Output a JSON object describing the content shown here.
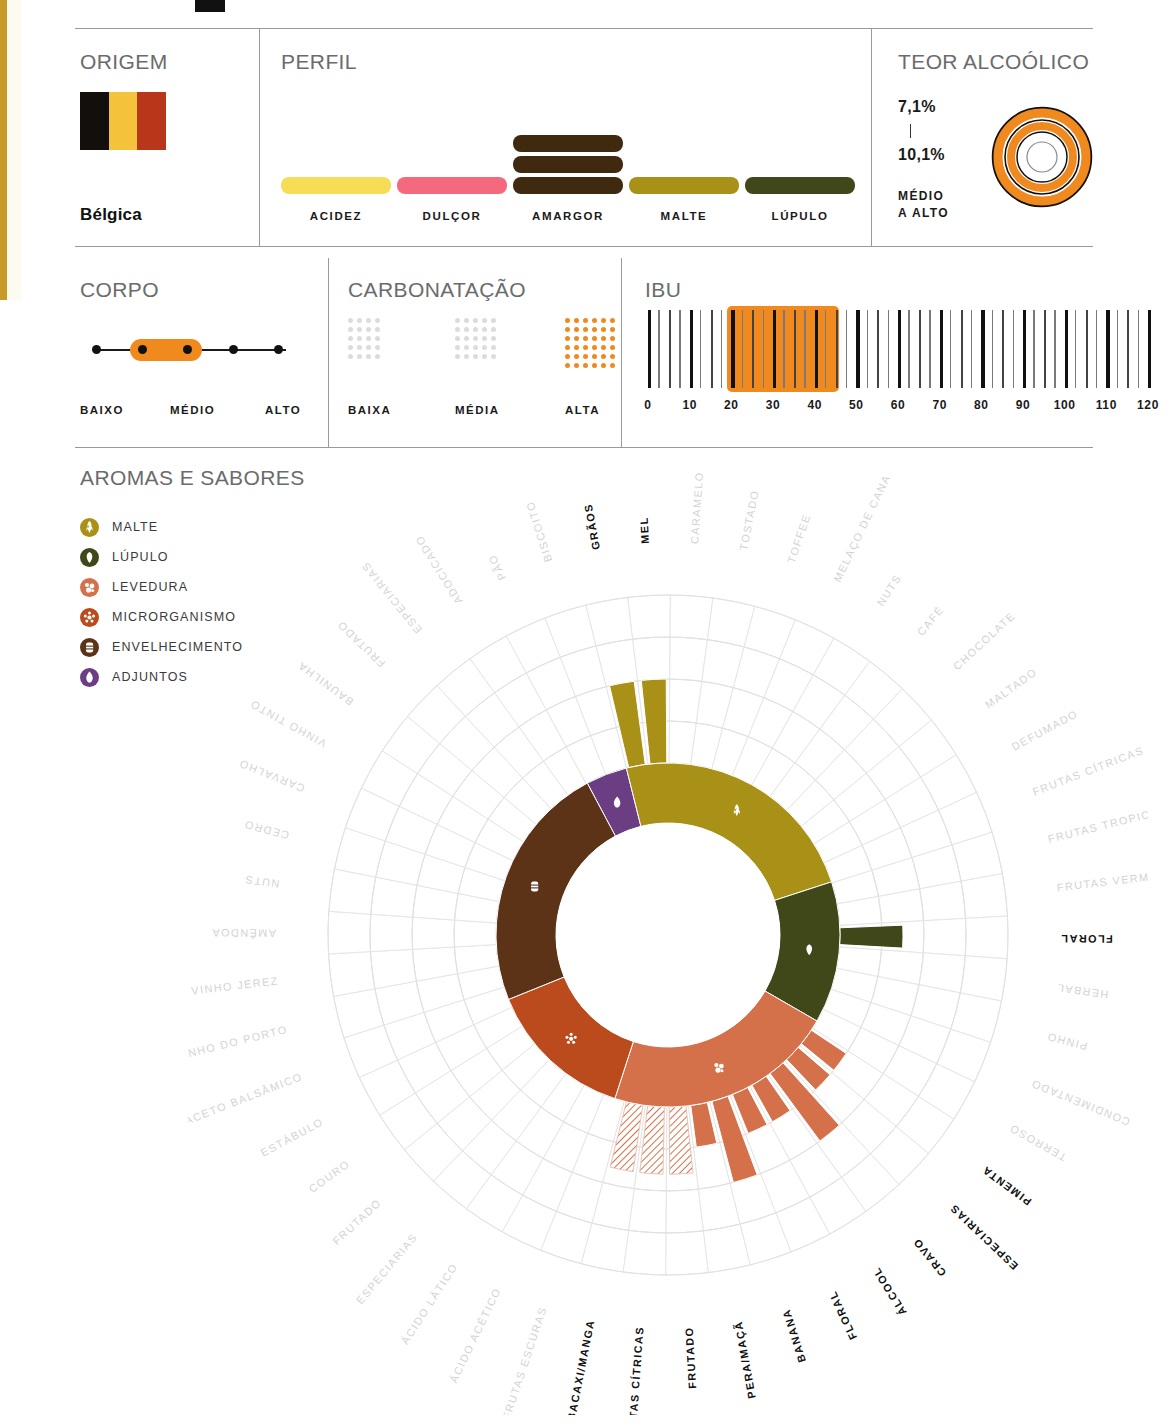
{
  "decor": {
    "left_strip_color": "#c89a2a",
    "accent_orange": "#f08a1e"
  },
  "origem": {
    "title": "ORIGEM",
    "country": "Bélgica",
    "flag_colors": [
      "#120f0d",
      "#f5c33b",
      "#b8371a"
    ]
  },
  "perfil": {
    "title": "PERFIL",
    "items": [
      {
        "label": "ACIDEZ",
        "levels": 1,
        "color": "#f7dd56"
      },
      {
        "label": "DULÇOR",
        "levels": 1,
        "color": "#f4697e"
      },
      {
        "label": "AMARGOR",
        "levels": 3,
        "color": "#3f2a10"
      },
      {
        "label": "MALTE",
        "levels": 1,
        "color": "#a99118"
      },
      {
        "label": "LÚPULO",
        "levels": 1,
        "color": "#40481a"
      }
    ]
  },
  "teor_alcoolico": {
    "title": "TEOR ALCOÓLICO",
    "min": "7,1%",
    "max": "10,1%",
    "qualifier_line1": "MÉDIO",
    "qualifier_line2": "A ALTO",
    "ring_color": "#f08a1e",
    "rings_filled": 2
  },
  "corpo": {
    "title": "CORPO",
    "labels": [
      "BAIXO",
      "MÉDIO",
      "ALTO"
    ],
    "points": 5,
    "selected_from": 2,
    "selected_to": 3
  },
  "carbonatacao": {
    "title": "CARBONATAÇÃO",
    "options": [
      {
        "label": "BAIXA",
        "cols": 4,
        "rows": 5,
        "active": false
      },
      {
        "label": "MÉDIA",
        "cols": 5,
        "rows": 5,
        "active": false
      },
      {
        "label": "ALTA",
        "cols": 6,
        "rows": 6,
        "active": true
      }
    ],
    "active_color": "#f08a1e",
    "inactive_color": "#dcdcdc"
  },
  "ibu": {
    "title": "IBU",
    "ticks": [
      "0",
      "10",
      "20",
      "30",
      "40",
      "50",
      "60",
      "70",
      "80",
      "90",
      "100",
      "110",
      "120"
    ],
    "min": 0,
    "max": 120,
    "range_from": 20,
    "range_to": 45,
    "highlight_color": "#f08a1e"
  },
  "aromas": {
    "title": "AROMAS E SABORES",
    "legend": [
      {
        "label": "MALTE",
        "color": "#a99118",
        "icon": "grain-icon"
      },
      {
        "label": "LÚPULO",
        "color": "#40481a",
        "icon": "hop-icon"
      },
      {
        "label": "LEVEDURA",
        "color": "#d4714a",
        "icon": "yeast-icon"
      },
      {
        "label": "MICRORGANISMO",
        "color": "#bb4a1d",
        "icon": "microbe-icon"
      },
      {
        "label": "ENVELHECIMENTO",
        "color": "#5c3317",
        "icon": "barrel-icon"
      },
      {
        "label": "ADJUNTOS",
        "color": "#6b3d82",
        "icon": "drop-icon"
      }
    ],
    "chart_data": {
      "type": "pie",
      "title": "AROMAS E SABORES",
      "legend_position": "top-left",
      "categories_label": "aroma descriptors arranged radially, clockwise from top",
      "note": "inner ring = family, outer petal length = intensity (0-4 rings); hatched = partial/secondary",
      "families": [
        {
          "name": "ADJUNTOS",
          "color": "#6b3d82",
          "start_deg": -14,
          "end_deg": 0
        },
        {
          "name": "MALTE",
          "color": "#a99118",
          "start_deg": 0,
          "end_deg": 86
        },
        {
          "name": "LÚPULO",
          "color": "#40481a",
          "start_deg": 86,
          "end_deg": 134
        },
        {
          "name": "LEVEDURA",
          "color": "#d4714a",
          "start_deg": 134,
          "end_deg": 212
        },
        {
          "name": "MICRORGANISMO",
          "color": "#bb4a1d",
          "start_deg": 212,
          "end_deg": 262
        },
        {
          "name": "ENVELHECIMENTO",
          "color": "#5c3317",
          "start_deg": 262,
          "end_deg": 346
        }
      ],
      "descriptors": [
        {
          "label": "GRÃOS",
          "family": "MALTE",
          "active": true,
          "petal": 2,
          "hatched": false
        },
        {
          "label": "MEL",
          "family": "MALTE",
          "active": true,
          "petal": 2,
          "hatched": false
        },
        {
          "label": "CARAMELO",
          "family": "MALTE",
          "active": false,
          "petal": 0,
          "hatched": false
        },
        {
          "label": "TOSTADO",
          "family": "MALTE",
          "active": false,
          "petal": 0,
          "hatched": false
        },
        {
          "label": "TOFFEE",
          "family": "MALTE",
          "active": false,
          "petal": 0,
          "hatched": false
        },
        {
          "label": "MELAÇO DE CANA",
          "family": "MALTE",
          "active": false,
          "petal": 0,
          "hatched": false
        },
        {
          "label": "NUTS",
          "family": "MALTE",
          "active": false,
          "petal": 0,
          "hatched": false
        },
        {
          "label": "CAFÉ",
          "family": "MALTE",
          "active": false,
          "petal": 0,
          "hatched": false
        },
        {
          "label": "CHOCOLATE",
          "family": "MALTE",
          "active": false,
          "petal": 0,
          "hatched": false
        },
        {
          "label": "MALTADO",
          "family": "MALTE",
          "active": false,
          "petal": 0,
          "hatched": false
        },
        {
          "label": "DEFUMADO",
          "family": "LÚPULO",
          "active": false,
          "petal": 0,
          "hatched": false
        },
        {
          "label": "FRUTAS CÍTRICAS",
          "family": "LÚPULO",
          "active": false,
          "petal": 0,
          "hatched": false
        },
        {
          "label": "FRUTAS TROPICAIS",
          "family": "LÚPULO",
          "active": false,
          "petal": 0,
          "hatched": false
        },
        {
          "label": "FRUTAS VERMELHAS",
          "family": "LÚPULO",
          "active": false,
          "petal": 0,
          "hatched": false
        },
        {
          "label": "FLORAL",
          "family": "LÚPULO",
          "active": true,
          "petal": 1.5,
          "hatched": false
        },
        {
          "label": "HERBAL",
          "family": "LÚPULO",
          "active": false,
          "petal": 0,
          "hatched": false
        },
        {
          "label": "PINHO",
          "family": "LÚPULO",
          "active": false,
          "petal": 0,
          "hatched": false
        },
        {
          "label": "CONDIMENTADO",
          "family": "LEVEDURA",
          "active": false,
          "petal": 0,
          "hatched": false
        },
        {
          "label": "TERROSO",
          "family": "LEVEDURA",
          "active": false,
          "petal": 0,
          "hatched": false
        },
        {
          "label": "PIMENTA",
          "family": "LEVEDURA",
          "active": true,
          "petal": 1,
          "hatched": false
        },
        {
          "label": "ESPECIARIAS",
          "family": "LEVEDURA",
          "active": true,
          "petal": 1,
          "hatched": false
        },
        {
          "label": "CRAVO",
          "family": "LEVEDURA",
          "active": true,
          "petal": 2,
          "hatched": false
        },
        {
          "label": "ÁLCOOL",
          "family": "LEVEDURA",
          "active": true,
          "petal": 1,
          "hatched": false
        },
        {
          "label": "FLORAL",
          "family": "LEVEDURA",
          "active": true,
          "petal": 1,
          "hatched": false
        },
        {
          "label": "BANANA",
          "family": "LEVEDURA",
          "active": true,
          "petal": 2,
          "hatched": false
        },
        {
          "label": "PERA/MAÇÃ",
          "family": "LEVEDURA",
          "active": true,
          "petal": 1,
          "hatched": false
        },
        {
          "label": "FRUTADO",
          "family": "LEVEDURA",
          "active": true,
          "petal": 1.6,
          "hatched": true
        },
        {
          "label": "FRUTAS CÍTRICAS",
          "family": "LEVEDURA",
          "active": true,
          "petal": 1.6,
          "hatched": true
        },
        {
          "label": "ABACAXI/MANGA",
          "family": "LEVEDURA",
          "active": true,
          "petal": 1.6,
          "hatched": true
        },
        {
          "label": "FRUTAS ESCURAS",
          "family": "MICRORGANISMO",
          "active": false,
          "petal": 0,
          "hatched": false
        },
        {
          "label": "ÁCIDO ACÉTICO",
          "family": "MICRORGANISMO",
          "active": false,
          "petal": 0,
          "hatched": false
        },
        {
          "label": "ÁCIDO LÁTICO",
          "family": "MICRORGANISMO",
          "active": false,
          "petal": 0,
          "hatched": false
        },
        {
          "label": "ESPECIARIAS",
          "family": "MICRORGANISMO",
          "active": false,
          "petal": 0,
          "hatched": false
        },
        {
          "label": "FRUTADO",
          "family": "MICRORGANISMO",
          "active": false,
          "petal": 0,
          "hatched": false
        },
        {
          "label": "COURO",
          "family": "MICRORGANISMO",
          "active": false,
          "petal": 0,
          "hatched": false
        },
        {
          "label": "ESTÁBULO",
          "family": "ENVELHECIMENTO",
          "active": false,
          "petal": 0,
          "hatched": false
        },
        {
          "label": "ACETO BALSÂMICO",
          "family": "ENVELHECIMENTO",
          "active": false,
          "petal": 0,
          "hatched": false
        },
        {
          "label": "VINHO DO PORTO",
          "family": "ENVELHECIMENTO",
          "active": false,
          "petal": 0,
          "hatched": false
        },
        {
          "label": "VINHO JEREZ",
          "family": "ENVELHECIMENTO",
          "active": false,
          "petal": 0,
          "hatched": false
        },
        {
          "label": "AMÊNDOA",
          "family": "ENVELHECIMENTO",
          "active": false,
          "petal": 0,
          "hatched": false
        },
        {
          "label": "NUTS",
          "family": "ENVELHECIMENTO",
          "active": false,
          "petal": 0,
          "hatched": false
        },
        {
          "label": "CEDRO",
          "family": "ENVELHECIMENTO",
          "active": false,
          "petal": 0,
          "hatched": false
        },
        {
          "label": "CARVALHO",
          "family": "ENVELHECIMENTO",
          "active": false,
          "petal": 0,
          "hatched": false
        },
        {
          "label": "VINHO TINTO",
          "family": "ENVELHECIMENTO",
          "active": false,
          "petal": 0,
          "hatched": false
        },
        {
          "label": "BAUNILHA",
          "family": "ENVELHECIMENTO",
          "active": false,
          "petal": 0,
          "hatched": false
        },
        {
          "label": "FRUTADO",
          "family": "ADJUNTOS",
          "active": false,
          "petal": 0,
          "hatched": false
        },
        {
          "label": "ESPECIARIAS",
          "family": "ADJUNTOS",
          "active": false,
          "petal": 0,
          "hatched": false
        },
        {
          "label": "ADOCICADO",
          "family": "ADJUNTOS",
          "active": false,
          "petal": 0,
          "hatched": false
        },
        {
          "label": "PÃO",
          "family": "MALTE",
          "active": false,
          "petal": 0,
          "hatched": false
        },
        {
          "label": "BISCOITO",
          "family": "MALTE",
          "active": false,
          "petal": 0,
          "hatched": false
        }
      ]
    }
  }
}
